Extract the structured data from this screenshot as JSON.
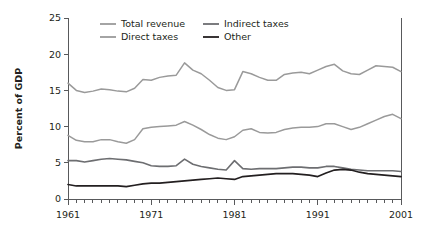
{
  "chart_data": {
    "type": "line",
    "title": "",
    "xlabel": "",
    "ylabel": "Percent of GDP",
    "xlim": [
      1961,
      2001
    ],
    "ylim": [
      0,
      25
    ],
    "yticks": [
      0,
      5,
      10,
      15,
      20,
      25
    ],
    "ytick_labels": [
      "0",
      "5",
      "10",
      "15",
      "20",
      "25"
    ],
    "xticks": [
      1961,
      1971,
      1981,
      1991,
      2001
    ],
    "xtick_labels": [
      "1961",
      "1971",
      "1981",
      "1991",
      "2001"
    ],
    "minor_xtick_interval": 1,
    "grid": false,
    "legend_position": "top-inside",
    "x": [
      1961,
      1962,
      1963,
      1964,
      1965,
      1966,
      1967,
      1968,
      1969,
      1970,
      1971,
      1972,
      1973,
      1974,
      1975,
      1976,
      1977,
      1978,
      1979,
      1980,
      1981,
      1982,
      1983,
      1984,
      1985,
      1986,
      1987,
      1988,
      1989,
      1990,
      1991,
      1992,
      1993,
      1994,
      1995,
      1996,
      1997,
      1998,
      1999,
      2000,
      2001
    ],
    "series": [
      {
        "name": "Total revenue",
        "color": "#9a9a9a",
        "width": 1.5,
        "values": [
          16.0,
          15.0,
          14.7,
          14.9,
          15.2,
          15.1,
          14.9,
          14.8,
          15.3,
          16.5,
          16.4,
          16.8,
          17.0,
          17.1,
          18.8,
          17.8,
          17.3,
          16.4,
          15.4,
          15.0,
          15.1,
          17.6,
          17.3,
          16.8,
          16.4,
          16.4,
          17.2,
          17.4,
          17.5,
          17.3,
          17.8,
          18.3,
          18.6,
          17.7,
          17.3,
          17.2,
          17.8,
          18.4,
          18.3,
          18.2,
          17.6
        ]
      },
      {
        "name": "Direct taxes",
        "color": "#9a9a9a",
        "width": 1.5,
        "values": [
          8.8,
          8.1,
          7.9,
          7.9,
          8.2,
          8.2,
          7.9,
          7.7,
          8.2,
          9.7,
          9.9,
          10.0,
          10.1,
          10.2,
          10.7,
          10.2,
          9.6,
          8.9,
          8.4,
          8.2,
          8.6,
          9.5,
          9.7,
          9.2,
          9.1,
          9.2,
          9.6,
          9.8,
          9.9,
          9.9,
          10.0,
          10.4,
          10.4,
          10.0,
          9.6,
          9.9,
          10.4,
          10.9,
          11.4,
          11.7,
          11.1
        ]
      },
      {
        "name": "Indirect taxes",
        "color": "#6d6e71",
        "width": 1.6,
        "values": [
          5.3,
          5.3,
          5.1,
          5.3,
          5.5,
          5.6,
          5.5,
          5.4,
          5.2,
          5.0,
          4.6,
          4.5,
          4.5,
          4.6,
          5.5,
          4.8,
          4.5,
          4.3,
          4.1,
          4.0,
          5.3,
          4.2,
          4.1,
          4.2,
          4.2,
          4.2,
          4.3,
          4.4,
          4.4,
          4.3,
          4.3,
          4.5,
          4.5,
          4.3,
          4.1,
          4.0,
          3.9,
          3.9,
          3.9,
          3.9,
          3.8
        ]
      },
      {
        "name": "Other",
        "color": "#231f20",
        "width": 1.7,
        "values": [
          2.0,
          1.8,
          1.8,
          1.8,
          1.8,
          1.8,
          1.8,
          1.7,
          1.9,
          2.1,
          2.2,
          2.2,
          2.3,
          2.4,
          2.5,
          2.6,
          2.7,
          2.8,
          2.9,
          2.8,
          2.7,
          3.1,
          3.2,
          3.3,
          3.4,
          3.5,
          3.5,
          3.5,
          3.4,
          3.3,
          3.1,
          3.6,
          4.0,
          4.1,
          4.0,
          3.7,
          3.5,
          3.4,
          3.3,
          3.2,
          3.1
        ]
      }
    ],
    "legend": [
      {
        "label": "Total revenue",
        "color": "#9a9a9a",
        "col": 0,
        "row": 0
      },
      {
        "label": "Direct taxes",
        "color": "#9a9a9a",
        "col": 0,
        "row": 1
      },
      {
        "label": "Indirect taxes",
        "color": "#6d6e71",
        "col": 1,
        "row": 0
      },
      {
        "label": "Other",
        "color": "#231f20",
        "col": 1,
        "row": 1
      }
    ]
  }
}
